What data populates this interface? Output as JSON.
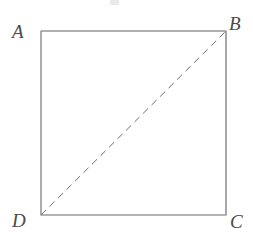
{
  "figure": {
    "kind": "geometry-diagram",
    "shape": "square",
    "background_color": "#ffffff",
    "canvas": {
      "width": 253,
      "height": 242
    },
    "square": {
      "left": 41,
      "top": 31,
      "right": 226,
      "bottom": 215,
      "stroke_color": "#8c8c8c",
      "stroke_width": 1,
      "fill": "none"
    },
    "diagonal": {
      "from": "D",
      "to": "B",
      "x1": 41,
      "y1": 215,
      "x2": 226,
      "y2": 31,
      "style": "dashed",
      "dash_pattern": "7 5",
      "stroke_color": "#6e6e6e",
      "stroke_width": 1
    },
    "vertices": [
      {
        "id": "A",
        "label": "A",
        "position": "top-left",
        "x": 41,
        "y": 31
      },
      {
        "id": "B",
        "label": "B",
        "position": "top-right",
        "x": 226,
        "y": 31
      },
      {
        "id": "C",
        "label": "C",
        "position": "bottom-right",
        "x": 226,
        "y": 215
      },
      {
        "id": "D",
        "label": "D",
        "position": "bottom-left",
        "x": 41,
        "y": 215
      }
    ],
    "label_color": "#4a4a4a"
  }
}
